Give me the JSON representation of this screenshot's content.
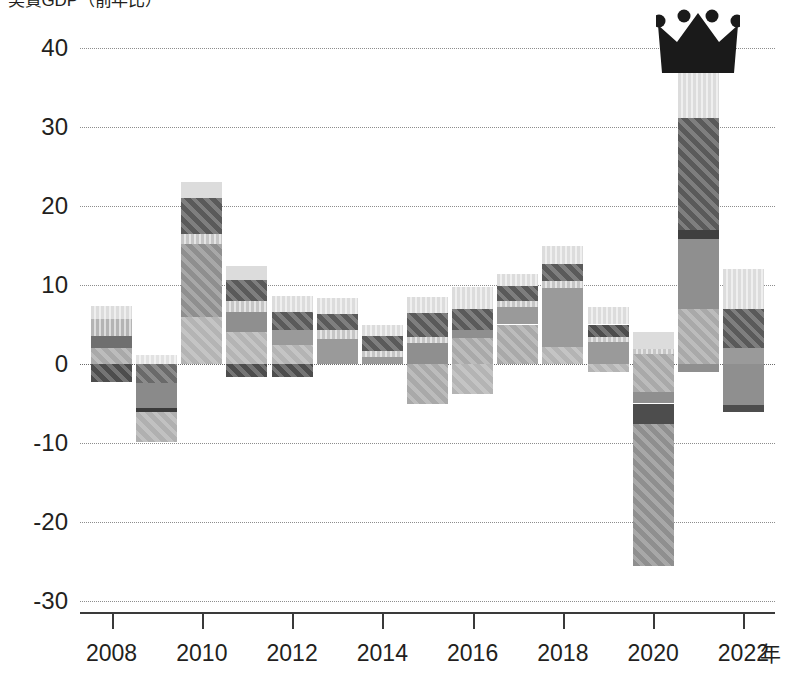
{
  "chart_data": {
    "type": "bar",
    "subtype": "stacked-bar-with-negatives",
    "title": "実質GDP（前年比）",
    "xlabel": "年",
    "ylabel": "",
    "ylim": [
      -30,
      40
    ],
    "yticks": [
      40,
      30,
      20,
      10,
      0,
      -10,
      -20,
      -30
    ],
    "ytick_labels": [
      "40",
      "30",
      "20",
      "10",
      "0",
      "-10",
      "-20",
      "-30"
    ],
    "xlim": [
      2007.3,
      2022.7
    ],
    "xticks": [
      2008,
      2010,
      2012,
      2014,
      2016,
      2018,
      2020,
      2022
    ],
    "xtick_labels": [
      "2008",
      "2010",
      "2012",
      "2014",
      "2016",
      "2018",
      "2020",
      "2022"
    ],
    "grid": "horizontal-dotted",
    "legend": "none",
    "annotations": [
      {
        "name": "crown",
        "target_year": 2021,
        "description": "black four-point crown marker placed above the tallest bar (2021)"
      }
    ],
    "categories": [
      2008,
      2009,
      2010,
      2011,
      2012,
      2013,
      2014,
      2015,
      2016,
      2017,
      2018,
      2019,
      2020,
      2021,
      2022
    ],
    "series": [
      {
        "name": "series-1",
        "color": "#4d4d4d",
        "values": [
          -2.3,
          -3.2,
          0.6,
          -1.6,
          -1.6,
          0.0,
          0.0,
          -5.0,
          -3.8,
          0.0,
          0.0,
          -1.0,
          -25.6,
          0.0,
          -6.1
        ]
      },
      {
        "name": "series-2",
        "color": "#8f8f8f",
        "values": [
          2.0,
          -2.5,
          5.9,
          5.9,
          4.2,
          2.3,
          1.6,
          6.4,
          4.3,
          4.7,
          2.0,
          3.1,
          -1.0,
          7.0,
          2.1
        ]
      },
      {
        "name": "series-3",
        "color": "#bdbdbd",
        "values": [
          1.5,
          -4.3,
          0.0,
          0.9,
          1.1,
          1.3,
          1.9,
          0.0,
          0.0,
          1.2,
          3.0,
          0.8,
          1.1,
          9.2,
          0.0
        ]
      },
      {
        "name": "series-4",
        "color": "#5a5a5a",
        "values": [
          2.2,
          0.0,
          9.6,
          3.3,
          2.2,
          3.2,
          0.0,
          2.8,
          3.4,
          3.1,
          5.0,
          0.0,
          1.0,
          14.9,
          4.7
        ]
      },
      {
        "name": "series-5",
        "color": "#d8d8d8",
        "values": [
          1.6,
          1.1,
          7.0,
          2.3,
          1.1,
          1.6,
          1.4,
          1.5,
          2.0,
          2.4,
          5.0,
          3.3,
          2.0,
          6.2,
          5.2
        ]
      }
    ],
    "totals": [
      7.3,
      -9.9,
      23.1,
      12.4,
      8.6,
      8.4,
      4.9,
      10.7,
      9.7,
      11.4,
      15.0,
      7.2,
      4.1,
      37.3,
      12.0
    ],
    "negative_totals": [
      -2.3,
      -9.9,
      0.0,
      -1.6,
      -1.6,
      0.0,
      0.0,
      -5.0,
      -3.8,
      0.0,
      0.0,
      -1.0,
      -25.6,
      0.0,
      -6.1
    ],
    "bars": [
      {
        "year": 2008,
        "top": 7.3,
        "bottom": -2.3,
        "segments": [
          {
            "from": 5.7,
            "to": 7.3,
            "color": "#dcdcdc",
            "texture": "vstripe"
          },
          {
            "from": 3.5,
            "to": 5.7,
            "color": "#b4b4b4",
            "texture": "vstripe"
          },
          {
            "from": 2.0,
            "to": 3.5,
            "color": "#6f6f6f",
            "texture": "flat"
          },
          {
            "from": 0.0,
            "to": 2.0,
            "color": "#a9a9a9",
            "texture": "diag"
          },
          {
            "from": -2.3,
            "to": 0.0,
            "color": "#4d4d4d",
            "texture": "diag"
          }
        ]
      },
      {
        "year": 2009,
        "top": 1.1,
        "bottom": -9.9,
        "segments": [
          {
            "from": 0.0,
            "to": 1.1,
            "color": "#e2e2e2",
            "texture": "vstripe"
          },
          {
            "from": -2.4,
            "to": 0.0,
            "color": "#6a6a6a",
            "texture": "diag"
          },
          {
            "from": -5.6,
            "to": -2.4,
            "color": "#8a8a8a",
            "texture": "flat"
          },
          {
            "from": -6.1,
            "to": -5.6,
            "color": "#3a3a3a",
            "texture": "flat"
          },
          {
            "from": -9.9,
            "to": -6.1,
            "color": "#b0b0b0",
            "texture": "diag"
          }
        ]
      },
      {
        "year": 2010,
        "top": 23.1,
        "bottom": 0.0,
        "segments": [
          {
            "from": 21.0,
            "to": 23.1,
            "color": "#dcdcdc",
            "texture": "flat"
          },
          {
            "from": 16.5,
            "to": 21.0,
            "color": "#5a5a5a",
            "texture": "diag"
          },
          {
            "from": 15.2,
            "to": 16.5,
            "color": "#c6c6c6",
            "texture": "vstripe"
          },
          {
            "from": 6.0,
            "to": 15.2,
            "color": "#8f8f8f",
            "texture": "diag"
          },
          {
            "from": 0.0,
            "to": 6.0,
            "color": "#b4b4b4",
            "texture": "diag"
          }
        ]
      },
      {
        "year": 2011,
        "top": 12.4,
        "bottom": -1.6,
        "segments": [
          {
            "from": 10.6,
            "to": 12.4,
            "color": "#dcdcdc",
            "texture": "flat"
          },
          {
            "from": 8.0,
            "to": 10.6,
            "color": "#5a5a5a",
            "texture": "diag"
          },
          {
            "from": 6.6,
            "to": 8.0,
            "color": "#c6c6c6",
            "texture": "vstripe"
          },
          {
            "from": 4.0,
            "to": 6.6,
            "color": "#8f8f8f",
            "texture": "flat"
          },
          {
            "from": 0.0,
            "to": 4.0,
            "color": "#b4b4b4",
            "texture": "diag"
          },
          {
            "from": -1.6,
            "to": 0.0,
            "color": "#4d4d4d",
            "texture": "diag"
          }
        ]
      },
      {
        "year": 2012,
        "top": 8.6,
        "bottom": -1.6,
        "segments": [
          {
            "from": 6.6,
            "to": 8.6,
            "color": "#dcdcdc",
            "texture": "vstripe"
          },
          {
            "from": 4.3,
            "to": 6.6,
            "color": "#5a5a5a",
            "texture": "diag"
          },
          {
            "from": 2.4,
            "to": 4.3,
            "color": "#9a9a9a",
            "texture": "flat"
          },
          {
            "from": 0.0,
            "to": 2.4,
            "color": "#b4b4b4",
            "texture": "diag"
          },
          {
            "from": -1.6,
            "to": 0.0,
            "color": "#4d4d4d",
            "texture": "diag"
          }
        ]
      },
      {
        "year": 2013,
        "top": 8.4,
        "bottom": 0.0,
        "segments": [
          {
            "from": 6.3,
            "to": 8.4,
            "color": "#dcdcdc",
            "texture": "vstripe"
          },
          {
            "from": 4.3,
            "to": 6.3,
            "color": "#5a5a5a",
            "texture": "diag"
          },
          {
            "from": 3.2,
            "to": 4.3,
            "color": "#c6c6c6",
            "texture": "vstripe"
          },
          {
            "from": 0.0,
            "to": 3.2,
            "color": "#9a9a9a",
            "texture": "flat"
          }
        ]
      },
      {
        "year": 2014,
        "top": 4.9,
        "bottom": 0.0,
        "segments": [
          {
            "from": 3.5,
            "to": 4.9,
            "color": "#dcdcdc",
            "texture": "vstripe"
          },
          {
            "from": 1.6,
            "to": 3.5,
            "color": "#5a5a5a",
            "texture": "diag"
          },
          {
            "from": 0.9,
            "to": 1.6,
            "color": "#c6c6c6",
            "texture": "vstripe"
          },
          {
            "from": 0.0,
            "to": 0.9,
            "color": "#9a9a9a",
            "texture": "flat"
          }
        ]
      },
      {
        "year": 2015,
        "top": 8.5,
        "bottom": -5.0,
        "segments": [
          {
            "from": 6.5,
            "to": 8.5,
            "color": "#dcdcdc",
            "texture": "vstripe"
          },
          {
            "from": 3.4,
            "to": 6.5,
            "color": "#5a5a5a",
            "texture": "diag"
          },
          {
            "from": 2.7,
            "to": 3.4,
            "color": "#c6c6c6",
            "texture": "vstripe"
          },
          {
            "from": 0.0,
            "to": 2.7,
            "color": "#8f8f8f",
            "texture": "flat"
          },
          {
            "from": -5.0,
            "to": 0.0,
            "color": "#a9a9a9",
            "texture": "diag"
          }
        ]
      },
      {
        "year": 2016,
        "top": 9.7,
        "bottom": -3.8,
        "segments": [
          {
            "from": 7.0,
            "to": 9.7,
            "color": "#dcdcdc",
            "texture": "vstripe"
          },
          {
            "from": 4.3,
            "to": 7.0,
            "color": "#5a5a5a",
            "texture": "diag"
          },
          {
            "from": 3.3,
            "to": 4.3,
            "color": "#8f8f8f",
            "texture": "flat"
          },
          {
            "from": 0.0,
            "to": 3.3,
            "color": "#a9a9a9",
            "texture": "diag"
          },
          {
            "from": -3.8,
            "to": 0.0,
            "color": "#b4b4b4",
            "texture": "diag"
          }
        ]
      },
      {
        "year": 2017,
        "top": 11.4,
        "bottom": 0.0,
        "segments": [
          {
            "from": 9.9,
            "to": 11.4,
            "color": "#dcdcdc",
            "texture": "vstripe"
          },
          {
            "from": 8.0,
            "to": 9.9,
            "color": "#5a5a5a",
            "texture": "diag"
          },
          {
            "from": 7.2,
            "to": 8.0,
            "color": "#c6c6c6",
            "texture": "vstripe"
          },
          {
            "from": 5.0,
            "to": 7.2,
            "color": "#9a9a9a",
            "texture": "flat"
          },
          {
            "from": 0.0,
            "to": 5.0,
            "color": "#a9a9a9",
            "texture": "diag"
          }
        ]
      },
      {
        "year": 2018,
        "top": 15.0,
        "bottom": 0.0,
        "segments": [
          {
            "from": 12.7,
            "to": 15.0,
            "color": "#dcdcdc",
            "texture": "vstripe"
          },
          {
            "from": 10.5,
            "to": 12.7,
            "color": "#5a5a5a",
            "texture": "diag"
          },
          {
            "from": 9.6,
            "to": 10.5,
            "color": "#c6c6c6",
            "texture": "vstripe"
          },
          {
            "from": 2.2,
            "to": 9.6,
            "color": "#9a9a9a",
            "texture": "flat"
          },
          {
            "from": 0.0,
            "to": 2.2,
            "color": "#b4b4b4",
            "texture": "diag"
          }
        ]
      },
      {
        "year": 2019,
        "top": 7.2,
        "bottom": -1.0,
        "segments": [
          {
            "from": 5.0,
            "to": 7.2,
            "color": "#dcdcdc",
            "texture": "vstripe"
          },
          {
            "from": 3.4,
            "to": 5.0,
            "color": "#4d4d4d",
            "texture": "diag"
          },
          {
            "from": 2.8,
            "to": 3.4,
            "color": "#c6c6c6",
            "texture": "vstripe"
          },
          {
            "from": 0.0,
            "to": 2.8,
            "color": "#9a9a9a",
            "texture": "flat"
          },
          {
            "from": -1.0,
            "to": 0.0,
            "color": "#b4b4b4",
            "texture": "diag"
          }
        ]
      },
      {
        "year": 2020,
        "top": 4.1,
        "bottom": -25.6,
        "segments": [
          {
            "from": 1.9,
            "to": 4.1,
            "color": "#dcdcdc",
            "texture": "flat"
          },
          {
            "from": 1.3,
            "to": 1.9,
            "color": "#c6c6c6",
            "texture": "vstripe"
          },
          {
            "from": -3.6,
            "to": 1.3,
            "color": "#a9a9a9",
            "texture": "diag"
          },
          {
            "from": -5.0,
            "to": -3.6,
            "color": "#8f8f8f",
            "texture": "flat"
          },
          {
            "from": -7.6,
            "to": -5.0,
            "color": "#4d4d4d",
            "texture": "flat"
          },
          {
            "from": -25.6,
            "to": -7.6,
            "color": "#8f8f8f",
            "texture": "diag"
          }
        ]
      },
      {
        "year": 2021,
        "top": 37.3,
        "bottom": -1.0,
        "segments": [
          {
            "from": 31.1,
            "to": 37.3,
            "color": "#dcdcdc",
            "texture": "vstripe"
          },
          {
            "from": 17.0,
            "to": 31.1,
            "color": "#5a5a5a",
            "texture": "diag"
          },
          {
            "from": 15.8,
            "to": 17.0,
            "color": "#3f3f3f",
            "texture": "flat"
          },
          {
            "from": 7.0,
            "to": 15.8,
            "color": "#8f8f8f",
            "texture": "flat"
          },
          {
            "from": 0.0,
            "to": 7.0,
            "color": "#a9a9a9",
            "texture": "diag"
          },
          {
            "from": -1.0,
            "to": 0.0,
            "color": "#8f8f8f",
            "texture": "flat"
          }
        ]
      },
      {
        "year": 2022,
        "top": 12.0,
        "bottom": -6.1,
        "segments": [
          {
            "from": 7.0,
            "to": 12.0,
            "color": "#dcdcdc",
            "texture": "vstripe"
          },
          {
            "from": 2.0,
            "to": 7.0,
            "color": "#5a5a5a",
            "texture": "diag"
          },
          {
            "from": 0.0,
            "to": 2.0,
            "color": "#9a9a9a",
            "texture": "flat"
          },
          {
            "from": -5.2,
            "to": 0.0,
            "color": "#8f8f8f",
            "texture": "flat"
          },
          {
            "from": -6.1,
            "to": -5.2,
            "color": "#4d4d4d",
            "texture": "flat"
          }
        ]
      }
    ]
  },
  "colors": {
    "axis": "#3a3a3a",
    "grid": "#8d8d8d",
    "text": "#231f20",
    "crown": "#1a1a1a",
    "background": "#ffffff"
  }
}
